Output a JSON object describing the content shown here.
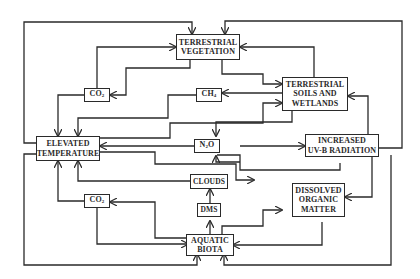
{
  "diagram": {
    "colors": {
      "line": "#2a2a2a",
      "background": "#ffffff"
    },
    "nodes": {
      "terrestrial_vegetation": {
        "line1": "TERRESTRIAL",
        "line2": "VEGETATION"
      },
      "terrestrial_soils": {
        "line1": "TERRESTRIAL",
        "line2": "SOILS AND",
        "line3": "WETLANDS"
      },
      "elevated_temperature": {
        "line1": "ELEVATED",
        "line2": "TEMPERATURE"
      },
      "increased_uvb": {
        "line1": "INCREASED",
        "line2": "UV-B RADIATION"
      },
      "dissolved_organic_matter": {
        "line1": "DISSOLVED",
        "line2": "ORGANIC",
        "line3": "MATTER"
      },
      "aquatic_biota": {
        "line1": "AQUATIC",
        "line2": "BIOTA"
      },
      "co2_upper": {
        "base": "CO",
        "sub": "2"
      },
      "co2_lower": {
        "base": "CO",
        "sub": "2"
      },
      "ch4": {
        "base": "CH",
        "sub": "4"
      },
      "n2o": {
        "base": "N",
        "sub": "2",
        "rest": "O"
      },
      "clouds": {
        "label": "CLOUDS"
      },
      "dms": {
        "label": "DMS"
      }
    }
  }
}
